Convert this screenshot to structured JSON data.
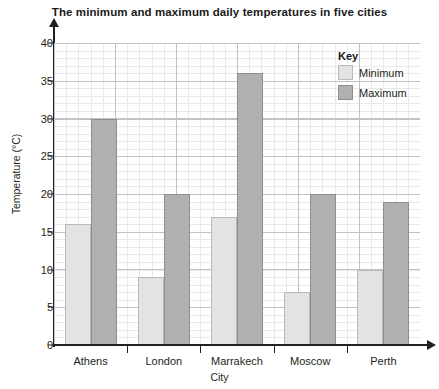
{
  "chart_data": {
    "type": "bar",
    "title": "The minimum and maximum daily temperatures in five cities",
    "xlabel": "City",
    "ylabel": "Temperature (°C)",
    "categories": [
      "Athens",
      "London",
      "Marrakech",
      "Moscow",
      "Perth"
    ],
    "series": [
      {
        "name": "Minimum",
        "values": [
          16,
          9,
          17,
          7,
          10
        ],
        "color": "#e3e3e3"
      },
      {
        "name": "Maximum",
        "values": [
          30,
          20,
          36,
          20,
          19
        ],
        "color": "#b0b0b0"
      }
    ],
    "ylim": [
      0,
      40
    ],
    "ytick_labels": [
      "0",
      "5",
      "10",
      "15",
      "20",
      "25",
      "30",
      "35",
      "40"
    ],
    "ytick_values": [
      0,
      5,
      10,
      15,
      20,
      25,
      30,
      35,
      40
    ],
    "minor_tick_step": 1,
    "grid": true,
    "legend": {
      "title": "Key",
      "position": "top-right"
    }
  },
  "legend": {
    "title": "Key",
    "entries": [
      {
        "label": "Minimum"
      },
      {
        "label": "Maximum"
      }
    ]
  }
}
